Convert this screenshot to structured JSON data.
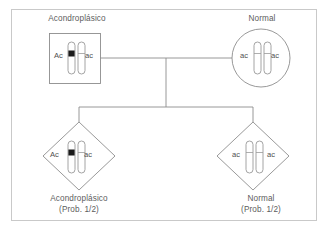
{
  "figure": {
    "type": "pedigree-diagram",
    "topic": "Herencia autosómica dominante (acondroplasia)",
    "border_color": "#c9c9c9",
    "line_color": "#8d8d8d",
    "text_color": "#5d5d5d",
    "mutant_band_color": "#1a1a1a"
  },
  "parents": {
    "father": {
      "shape": "square",
      "label": "Acondroplásico",
      "allele_left": "Ac",
      "allele_right": "ac",
      "genotype": "Ac/ac",
      "affected": true,
      "chromosomes": [
        {
          "side": "left",
          "band": true
        },
        {
          "side": "right",
          "band": false
        }
      ]
    },
    "mother": {
      "shape": "circle",
      "label": "Normal",
      "allele_left": "ac",
      "allele_right": "ac",
      "genotype": "ac/ac",
      "affected": false,
      "chromosomes": [
        {
          "side": "left",
          "band": false
        },
        {
          "side": "right",
          "band": false
        }
      ]
    }
  },
  "offspring": [
    {
      "shape": "diamond",
      "label": "Acondroplásico",
      "probability": "(Prob. 1/2)",
      "allele_left": "Ac",
      "allele_right": "ac",
      "genotype": "Ac/ac",
      "affected": true,
      "chromosomes": [
        {
          "side": "left",
          "band": true
        },
        {
          "side": "right",
          "band": false
        }
      ]
    },
    {
      "shape": "diamond",
      "label": "Normal",
      "probability": "(Prob. 1/2)",
      "allele_left": "ac",
      "allele_right": "ac",
      "genotype": "ac/ac",
      "affected": false,
      "chromosomes": [
        {
          "side": "left",
          "band": false
        },
        {
          "side": "right",
          "band": false
        }
      ]
    }
  ]
}
